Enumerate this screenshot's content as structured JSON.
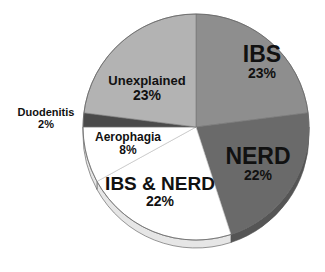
{
  "chart_data": {
    "type": "pie",
    "title": "",
    "style": "3d-tilted-pie",
    "start_angle": "12 o'clock",
    "direction": "clockwise",
    "slices": [
      {
        "label": "IBS",
        "value": 23,
        "display": "23%",
        "color": "#8e8e8e"
      },
      {
        "label": "NERD",
        "value": 22,
        "display": "22%",
        "color": "#6a6a6a"
      },
      {
        "label": "IBS & NERD",
        "value": 22,
        "display": "22%",
        "color": "#ffffff"
      },
      {
        "label": "Aerophagia",
        "value": 8,
        "display": "8%",
        "color": "#ffffff"
      },
      {
        "label": "Duodenitis",
        "value": 2,
        "display": "2%",
        "color": "#4a4a4a"
      },
      {
        "label": "Unexplained",
        "value": 23,
        "display": "23%",
        "color": "#b3b3b3"
      }
    ],
    "categories": [
      "IBS",
      "NERD",
      "IBS & NERD",
      "Aerophagia",
      "Duodenitis",
      "Unexplained"
    ],
    "values": [
      23,
      22,
      22,
      8,
      2,
      23
    ],
    "unit": "%",
    "legend": "none (labels on slices)"
  },
  "labels": {
    "ibs": {
      "name": "IBS",
      "pct": "23%"
    },
    "nerd": {
      "name": "NERD",
      "pct": "22%"
    },
    "ibs_nerd": {
      "name": "IBS & NERD",
      "pct": "22%"
    },
    "aerophagia": {
      "name": "Aerophagia",
      "pct": "8%"
    },
    "duodenitis": {
      "name": "Duodenitis",
      "pct": "2%"
    },
    "unexplained": {
      "name": "Unexplained",
      "pct": "23%"
    }
  }
}
